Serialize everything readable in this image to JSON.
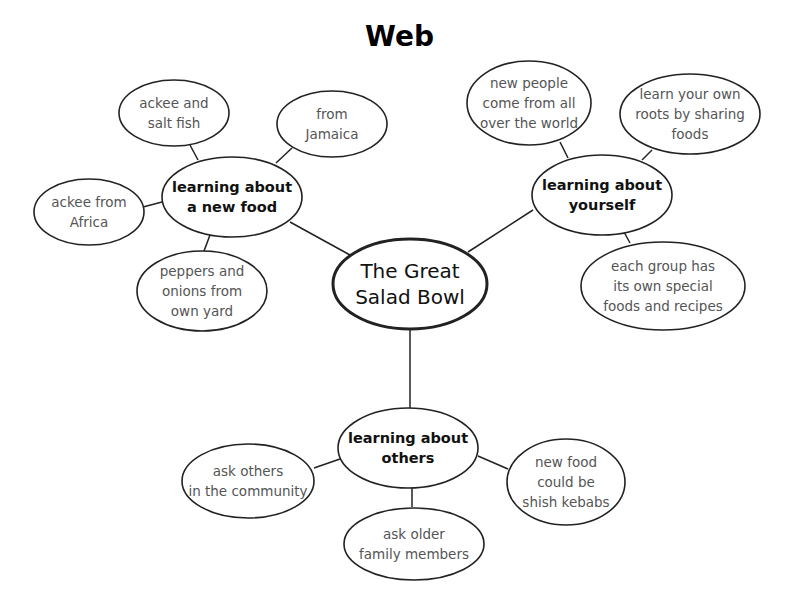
{
  "title": "Web",
  "center": {
    "label": "The Great\nSalad Bowl"
  },
  "hubs": [
    {
      "label": "learning about\na new food"
    },
    {
      "label": "learning about\nyourself"
    },
    {
      "label": "learning about\nothers"
    }
  ],
  "leaves": {
    "food": [
      {
        "label": "ackee and\nsalt fish"
      },
      {
        "label": "from\nJamaica"
      },
      {
        "label": "ackee from\nAfrica"
      },
      {
        "label": "peppers and\nonions from\nown yard"
      }
    ],
    "yourself": [
      {
        "label": "new people\ncome from all\nover the world"
      },
      {
        "label": "learn your own\nroots by sharing\nfoods"
      },
      {
        "label": "each group has\nits own special\nfoods and recipes"
      }
    ],
    "others": [
      {
        "label": "ask others\nin the community"
      },
      {
        "label": "ask older\nfamily members"
      },
      {
        "label": "new food\ncould be\nshish kebabs"
      }
    ]
  }
}
